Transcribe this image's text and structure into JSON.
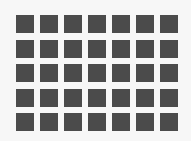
{
  "grid": {
    "columns": 7,
    "rows": 5,
    "cell_color": "#4b4b4b",
    "background_color": "#f7f7f7"
  }
}
